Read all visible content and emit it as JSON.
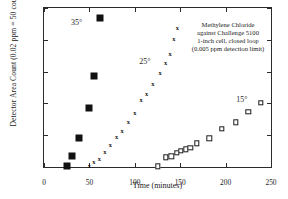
{
  "chart_data": {
    "type": "scatter",
    "title": "",
    "xlabel": "Time (minutes)",
    "ylabel": "Detector Area Count (0.02 ppm = 50 counts)",
    "xlim": [
      0,
      250
    ],
    "ylim": [
      0,
      250
    ],
    "xticks": [
      0,
      50,
      100,
      150,
      200,
      250
    ],
    "yticks": [
      0,
      50,
      100,
      150,
      200,
      250
    ],
    "grid": false,
    "legend_position": "inline-labels",
    "annotations": [
      "Methylene Chloride",
      "against Challenge 5100",
      "1-inch cell, closed loop",
      "(0.005 ppm detection limit)"
    ],
    "series": [
      {
        "name": "35°",
        "marker": "filled-square",
        "label_x": 36,
        "label_y": 228,
        "points": [
          [
            25,
            1
          ],
          [
            31,
            18
          ],
          [
            38,
            46
          ],
          [
            50,
            92
          ],
          [
            55,
            143
          ],
          [
            62,
            234
          ]
        ]
      },
      {
        "name": "25°",
        "marker": "x",
        "label_x": 111,
        "label_y": 166,
        "points": [
          [
            50,
            1
          ],
          [
            55,
            8
          ],
          [
            61,
            12
          ],
          [
            67,
            24
          ],
          [
            73,
            34
          ],
          [
            80,
            47
          ],
          [
            86,
            56
          ],
          [
            93,
            71
          ],
          [
            100,
            85
          ],
          [
            107,
            105
          ],
          [
            113,
            115
          ],
          [
            120,
            131
          ],
          [
            128,
            148
          ],
          [
            134,
            164
          ],
          [
            139,
            178
          ],
          [
            143,
            202
          ],
          [
            147,
            219
          ]
        ]
      },
      {
        "name": "15°",
        "marker": "open-square",
        "label_x": 218,
        "label_y": 107,
        "points": [
          [
            125,
            1
          ],
          [
            134,
            15
          ],
          [
            140,
            17
          ],
          [
            146,
            22
          ],
          [
            151,
            25
          ],
          [
            156,
            28
          ],
          [
            161,
            30
          ],
          [
            168,
            37
          ],
          [
            182,
            45
          ],
          [
            196,
            60
          ],
          [
            211,
            70
          ],
          [
            225,
            87
          ],
          [
            239,
            101
          ]
        ]
      }
    ]
  }
}
